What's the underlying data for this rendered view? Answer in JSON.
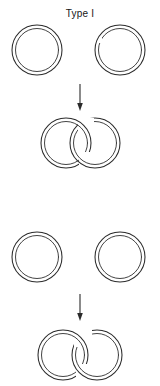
{
  "figure": {
    "background_color": "#ffffff",
    "stroke_color": "#2b2b2b",
    "width": 160,
    "height": 386
  },
  "panels": [
    {
      "id": "type-i",
      "label": "Type I",
      "label_position": {
        "x": 80,
        "y": 14
      },
      "reactants": [
        {
          "name": "ring-left",
          "shape": "double-circle",
          "cx": 37,
          "cy": 50,
          "outer_r": 25,
          "inner_r": 21.5,
          "gap": "none"
        },
        {
          "name": "ring-right",
          "shape": "double-circle",
          "cx": 120,
          "cy": 50,
          "outer_r": 25,
          "inner_r": 21.5,
          "gap": "left-inner"
        }
      ],
      "arrow": {
        "name": "reaction-arrow",
        "direction": "down",
        "x": 80,
        "y_start": 84,
        "y_end": 110
      },
      "product": {
        "name": "catenane-interlocked-rings",
        "description": "two interlocked double-walled rings",
        "left": {
          "cx": 66,
          "cy": 143,
          "outer_r": 25,
          "inner_r": 21.5
        },
        "right": {
          "cx": 95,
          "cy": 143,
          "outer_r": 25,
          "inner_r": 21.5
        },
        "crossing": "left-ring-over-right-at-top"
      }
    },
    {
      "id": "type-ii",
      "label": "Type II",
      "label_position": {
        "x": 80,
        "y": 212
      },
      "reactants": [
        {
          "name": "ring-left",
          "shape": "double-circle",
          "cx": 37,
          "cy": 257,
          "outer_r": 25,
          "inner_r": 21.5,
          "gap": "none"
        },
        {
          "name": "ring-right",
          "shape": "double-circle",
          "cx": 120,
          "cy": 257,
          "outer_r": 25,
          "inner_r": 21.5,
          "gap": "none"
        }
      ],
      "arrow": {
        "name": "reaction-arrow",
        "direction": "down",
        "x": 80,
        "y_start": 294,
        "y_end": 320
      },
      "product": {
        "name": "catenane-interlocked-rings",
        "description": "two interlocked double-walled rings",
        "left": {
          "cx": 63,
          "cy": 355,
          "outer_r": 25,
          "inner_r": 21.5
        },
        "right": {
          "cx": 97,
          "cy": 355,
          "outer_r": 25,
          "inner_r": 21.5
        },
        "crossing": "left-ring-over-right-at-top"
      }
    }
  ]
}
